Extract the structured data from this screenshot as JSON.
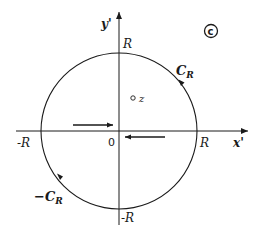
{
  "diagram": {
    "type": "contour-plot",
    "panel_label": "c",
    "axes": {
      "x_label": "x'",
      "y_label": "y'",
      "origin_label": "0"
    },
    "circle": {
      "radius_label": "R",
      "labels": {
        "top": "R",
        "bottom": "-R",
        "left": "-R",
        "right": "R"
      }
    },
    "contours": [
      {
        "name": "C",
        "subscript": "R",
        "prefix": "",
        "direction": "counterclockwise",
        "location": "upper-right arc"
      },
      {
        "name": "C",
        "subscript": "R",
        "prefix": "−",
        "direction": "counterclockwise",
        "location": "lower-left arc"
      }
    ],
    "point": {
      "label": "z"
    },
    "arrows": [
      {
        "position": "left of origin, above x-axis",
        "direction": "right"
      },
      {
        "position": "right of origin, below x-axis",
        "direction": "left"
      }
    ],
    "colors": {
      "ink": "#1a1a1a",
      "background": "#ffffff"
    }
  }
}
